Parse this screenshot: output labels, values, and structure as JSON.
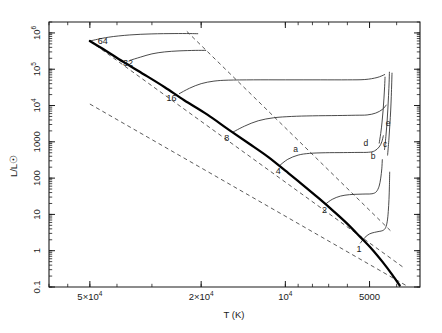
{
  "chart_data": {
    "type": "line",
    "title": "",
    "xlabel": "T (K)",
    "ylabel": "L/L☉",
    "xscale": "log",
    "yscale": "log",
    "x_reversed": true,
    "xlim": [
      70000,
      3300
    ],
    "ylim": [
      0.1,
      2000000
    ],
    "grid": false,
    "legend": "none",
    "xticks": [
      {
        "value": 50000,
        "label": "5×10",
        "sup": "4"
      },
      {
        "value": 20000,
        "label": "2×10",
        "sup": "4"
      },
      {
        "value": 10000,
        "label": "10",
        "sup": "4"
      },
      {
        "value": 5000,
        "label": "5000",
        "sup": ""
      }
    ],
    "yticks": [
      {
        "value": 1000000,
        "label": "10",
        "sup": "6"
      },
      {
        "value": 100000,
        "label": "10",
        "sup": "5"
      },
      {
        "value": 10000,
        "label": "10",
        "sup": "4"
      },
      {
        "value": 1000,
        "label": "1000",
        "sup": ""
      },
      {
        "value": 100,
        "label": "100",
        "sup": ""
      },
      {
        "value": 10,
        "label": "10",
        "sup": ""
      },
      {
        "value": 1,
        "label": "1",
        "sup": ""
      },
      {
        "value": 0.1,
        "label": "0.1",
        "sup": ""
      }
    ],
    "series": [
      {
        "name": "zero-age-main-sequence",
        "style": "thick-solid",
        "points": [
          [
            50000,
            600000
          ],
          [
            44000,
            330000
          ],
          [
            38000,
            160000
          ],
          [
            32000,
            72000
          ],
          [
            27000,
            32000
          ],
          [
            23000,
            14000
          ],
          [
            19000,
            5600
          ],
          [
            16000,
            2200
          ],
          [
            13500,
            900
          ],
          [
            11500,
            380
          ],
          [
            10000,
            160
          ],
          [
            8800,
            72
          ],
          [
            7600,
            28
          ],
          [
            6700,
            12
          ],
          [
            6000,
            5.5
          ],
          [
            5400,
            2.4
          ],
          [
            4900,
            1.1
          ],
          [
            4500,
            0.5
          ],
          [
            4150,
            0.22
          ],
          [
            3900,
            0.11
          ]
        ]
      },
      {
        "name": "track-64-msun",
        "style": "thin-solid",
        "points": [
          [
            50000,
            600000
          ],
          [
            43000,
            760000
          ],
          [
            36000,
            880000
          ],
          [
            30000,
            940000
          ],
          [
            25000,
            960000
          ],
          [
            22000,
            960000
          ],
          [
            20500,
            950000
          ]
        ]
      },
      {
        "name": "track-32-msun",
        "style": "thin-solid",
        "points": [
          [
            36000,
            175000
          ],
          [
            33000,
            215000
          ],
          [
            30000,
            265000
          ],
          [
            27000,
            300000
          ],
          [
            24000,
            320000
          ],
          [
            21000,
            330000
          ],
          [
            19200,
            330000
          ]
        ]
      },
      {
        "name": "track-16-msun",
        "style": "thin-solid",
        "points": [
          [
            24000,
            21000
          ],
          [
            22000,
            30000
          ],
          [
            20000,
            40000
          ],
          [
            18000,
            47000
          ],
          [
            16000,
            50000
          ],
          [
            13000,
            51000
          ],
          [
            10000,
            51000
          ],
          [
            7500,
            51000
          ],
          [
            6000,
            51000
          ],
          [
            5200,
            52000
          ],
          [
            4700,
            59000
          ],
          [
            4400,
            72000
          ]
        ]
      },
      {
        "name": "track-8-msun",
        "style": "thin-solid",
        "points": [
          [
            15500,
            1800
          ],
          [
            14000,
            2700
          ],
          [
            12500,
            3800
          ],
          [
            11000,
            4600
          ],
          [
            9500,
            5000
          ],
          [
            8000,
            5200
          ],
          [
            6500,
            5300
          ],
          [
            5600,
            5400
          ],
          [
            5100,
            5500
          ],
          [
            4750,
            6200
          ],
          [
            4500,
            7800
          ],
          [
            4350,
            10500
          ]
        ]
      },
      {
        "name": "track-4-msun",
        "style": "thin-solid",
        "points": [
          [
            10500,
            220
          ],
          [
            9800,
            330
          ],
          [
            9000,
            430
          ],
          [
            8200,
            480
          ],
          [
            7200,
            500
          ],
          [
            6200,
            505
          ],
          [
            5500,
            510
          ],
          [
            5050,
            515
          ],
          [
            4800,
            560
          ],
          [
            4620,
            720
          ],
          [
            4520,
            1000
          ],
          [
            4460,
            1500
          ]
        ]
      },
      {
        "name": "track-2-msun",
        "style": "thin-solid",
        "points": [
          [
            7200,
            19
          ],
          [
            6800,
            26
          ],
          [
            6350,
            32
          ],
          [
            5900,
            35
          ],
          [
            5500,
            36
          ],
          [
            5150,
            36.5
          ],
          [
            4900,
            37
          ],
          [
            4730,
            42
          ],
          [
            4620,
            60
          ],
          [
            4560,
            100
          ],
          [
            4520,
            180
          ],
          [
            4500,
            330
          ]
        ]
      },
      {
        "name": "track-1-msun",
        "style": "thin-solid",
        "points": [
          [
            5400,
            1.6
          ],
          [
            5200,
            2.3
          ],
          [
            5000,
            2.9
          ],
          [
            4800,
            3.2
          ],
          [
            4620,
            3.4
          ],
          [
            4480,
            3.6
          ],
          [
            4380,
            4.3
          ],
          [
            4320,
            6.5
          ],
          [
            4285,
            12
          ],
          [
            4260,
            26
          ],
          [
            4245,
            60
          ],
          [
            4235,
            150
          ]
        ]
      },
      {
        "name": "hayashi-track-b",
        "style": "thin-solid",
        "points": [
          [
            4620,
            900
          ],
          [
            4560,
            1700
          ],
          [
            4510,
            3500
          ],
          [
            4470,
            7500
          ],
          [
            4440,
            16000
          ],
          [
            4415,
            34000
          ],
          [
            4400,
            62000
          ]
        ]
      },
      {
        "name": "hayashi-track-c",
        "style": "thin-solid",
        "points": [
          [
            4420,
            600
          ],
          [
            4370,
            1400
          ],
          [
            4330,
            3300
          ],
          [
            4300,
            8000
          ],
          [
            4275,
            19000
          ],
          [
            4255,
            44000
          ],
          [
            4245,
            85000
          ]
        ]
      },
      {
        "name": "hayashi-track-e",
        "style": "thin-solid",
        "points": [
          [
            4310,
            420
          ],
          [
            4265,
            1100
          ],
          [
            4230,
            2900
          ],
          [
            4200,
            7500
          ],
          [
            4180,
            18000
          ],
          [
            4165,
            42000
          ],
          [
            4155,
            80000
          ]
        ]
      }
    ],
    "radius_lines": [
      {
        "name": "constant-radius-upper",
        "points": [
          [
            22500,
            1100000
          ],
          [
            4150,
            3.2
          ]
        ]
      },
      {
        "name": "constant-radius-middle",
        "points": [
          [
            50000,
            600000
          ],
          [
            3750,
            0.33
          ]
        ]
      },
      {
        "name": "constant-radius-lower",
        "points": [
          [
            50000,
            11000
          ],
          [
            3700,
            0.11
          ]
        ]
      }
    ],
    "mass_labels": [
      {
        "text": "64",
        "x": 45000,
        "y": 620000
      },
      {
        "text": "32",
        "x": 36500,
        "y": 150000
      },
      {
        "text": "16",
        "x": 25500,
        "y": 16000
      },
      {
        "text": "8",
        "x": 16200,
        "y": 1250
      },
      {
        "text": "4",
        "x": 10600,
        "y": 155
      },
      {
        "text": "2",
        "x": 7250,
        "y": 13
      },
      {
        "text": "1",
        "x": 5450,
        "y": 1.15
      }
    ],
    "annotations": [
      {
        "text": "a",
        "x": 9200,
        "y": 640
      },
      {
        "text": "b",
        "x": 4850,
        "y": 410
      },
      {
        "text": "c",
        "x": 4400,
        "y": 900
      },
      {
        "text": "d",
        "x": 5150,
        "y": 940
      },
      {
        "text": "e",
        "x": 4290,
        "y": 3400
      }
    ]
  }
}
